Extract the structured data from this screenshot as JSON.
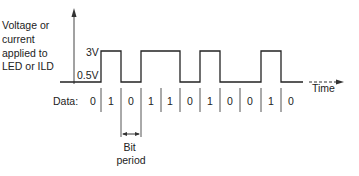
{
  "diagram": {
    "y_axis_label_lines": [
      "Voltage or",
      "current",
      "applied to",
      "LED or ILD"
    ],
    "levels": {
      "high": "3V",
      "low": "0.5V"
    },
    "x_axis_label": "Time",
    "data_prefix": "Data:",
    "bits": [
      "0",
      "1",
      "0",
      "1",
      "1",
      "0",
      "1",
      "0",
      "0",
      "1",
      "0"
    ],
    "bit_period_label_lines": [
      "Bit",
      "period"
    ],
    "colors": {
      "line": "#222222",
      "background": "#ffffff"
    }
  }
}
